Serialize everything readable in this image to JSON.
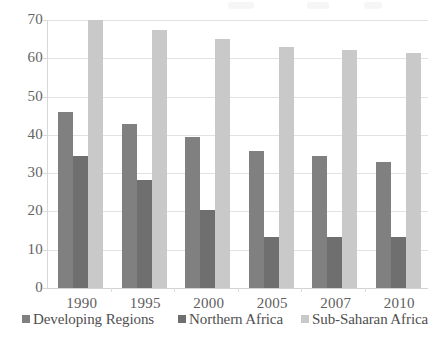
{
  "chart_data": {
    "type": "bar",
    "title": "",
    "subtitle": "",
    "xlabel": "",
    "ylabel": "",
    "categories": [
      "1990",
      "1995",
      "2000",
      "2005",
      "2007",
      "2010"
    ],
    "series": [
      {
        "name": "Developing Regions",
        "color": "#808080",
        "values": [
          46.0,
          42.8,
          39.5,
          35.9,
          34.4,
          32.8
        ]
      },
      {
        "name": "Northern Africa",
        "color": "#6f6f6f",
        "values": [
          34.4,
          28.3,
          20.3,
          13.4,
          13.4,
          13.4
        ]
      },
      {
        "name": "Sub-Saharan Africa",
        "color": "#c9c9c9",
        "values": [
          70.0,
          67.5,
          65.0,
          63.0,
          62.2,
          61.5
        ]
      }
    ],
    "ylim": [
      0,
      70
    ],
    "ytick_values": [
      0,
      10,
      20,
      30,
      40,
      50,
      60,
      70
    ],
    "ytick_labels": [
      "0",
      "10",
      "20",
      "30",
      "40",
      "50",
      "60",
      "70"
    ],
    "grid": true,
    "grid_axis": "y",
    "legend_position": "bottom"
  },
  "axis": {
    "y": {
      "ticks": [
        {
          "label": "70",
          "value": 70
        },
        {
          "label": "60",
          "value": 60
        },
        {
          "label": "50",
          "value": 50
        },
        {
          "label": "40",
          "value": 40
        },
        {
          "label": "30",
          "value": 30
        },
        {
          "label": "20",
          "value": 20
        },
        {
          "label": "10",
          "value": 10
        },
        {
          "label": "0",
          "value": 0
        }
      ]
    },
    "x": {
      "ticks": [
        {
          "label": "1990"
        },
        {
          "label": "1995"
        },
        {
          "label": "2000"
        },
        {
          "label": "2005"
        },
        {
          "label": "2007"
        },
        {
          "label": "2010"
        }
      ]
    }
  },
  "legend": {
    "items": [
      {
        "label": "Developing Regions",
        "color": "#808080"
      },
      {
        "label": "Northern Africa",
        "color": "#6f6f6f"
      },
      {
        "label": "Sub-Saharan Africa",
        "color": "#c9c9c9"
      }
    ]
  }
}
